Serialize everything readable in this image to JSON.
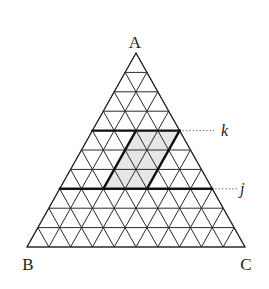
{
  "diagram": {
    "type": "ternary-triangular-grid",
    "divisions": 10,
    "vertices": {
      "A": {
        "label": "A",
        "position": "top"
      },
      "B": {
        "label": "B",
        "position": "bottom-left"
      },
      "C": {
        "label": "C",
        "position": "bottom-right"
      }
    },
    "highlighted_lines": [
      {
        "id": "k",
        "label": "k",
        "row": 4
      },
      {
        "id": "j",
        "label": "j",
        "row": 7
      }
    ],
    "shaded_region": {
      "shape": "parallelogram",
      "top_row": 4,
      "bottom_row": 7,
      "top_span": [
        2,
        4
      ],
      "bottom_span": [
        2,
        4
      ],
      "fill": "#e6e6e6"
    },
    "colors": {
      "line": "#2a2a2a",
      "thick_line": "#111111",
      "shade": "#e6e6e6",
      "background": "#ffffff"
    }
  }
}
